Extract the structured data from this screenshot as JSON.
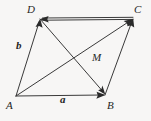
{
  "figure": {
    "kind": "vector-parallelogram-diagram",
    "background_color": "#f7f6f5",
    "stroke_color": "#3a3a3a",
    "stroke_width": 1,
    "width": 151,
    "height": 121,
    "vertices": [
      {
        "id": "D",
        "label": "D",
        "x": 40,
        "y": 19
      },
      {
        "id": "C",
        "label": "C",
        "x": 133,
        "y": 18
      },
      {
        "id": "A",
        "label": "A",
        "x": 16,
        "y": 96
      },
      {
        "id": "B",
        "label": "B",
        "x": 105,
        "y": 95
      }
    ],
    "edges": [
      {
        "id": "AB",
        "from": "A",
        "to": "B",
        "arrow_at": "B",
        "label": "a",
        "x1": 16,
        "y1": 96,
        "x2": 105,
        "y2": 95
      },
      {
        "id": "AD",
        "from": "A",
        "to": "D",
        "arrow_at": "D",
        "label": "b",
        "x1": 16,
        "y1": 96,
        "x2": 40,
        "y2": 19
      },
      {
        "id": "DC",
        "from": "D",
        "to": "C",
        "arrow_at": "D",
        "label": "",
        "x1": 133,
        "y1": 18,
        "x2": 40,
        "y2": 19
      },
      {
        "id": "BC",
        "from": "B",
        "to": "C",
        "arrow_at": "C",
        "label": "",
        "x1": 105,
        "y1": 95,
        "x2": 133,
        "y2": 18
      },
      {
        "id": "AC",
        "from": "A",
        "to": "C",
        "arrow_at": "C",
        "label": "M",
        "x1": 16,
        "y1": 96,
        "x2": 133,
        "y2": 18
      },
      {
        "id": "DB",
        "from": "D",
        "to": "B",
        "arrow_at": "B",
        "label": "",
        "x1": 40,
        "y1": 19,
        "x2": 105,
        "y2": 95
      }
    ],
    "vector_labels": [
      {
        "id": "a",
        "text": "a",
        "x": 60,
        "y": 94,
        "bold": true
      },
      {
        "id": "b",
        "text": "b",
        "x": 16,
        "y": 40,
        "bold": true
      },
      {
        "id": "M",
        "text": "M",
        "x": 92,
        "y": 52,
        "bold": false
      }
    ],
    "diagonal_intersection": {
      "x": 75,
      "y": 57
    }
  }
}
